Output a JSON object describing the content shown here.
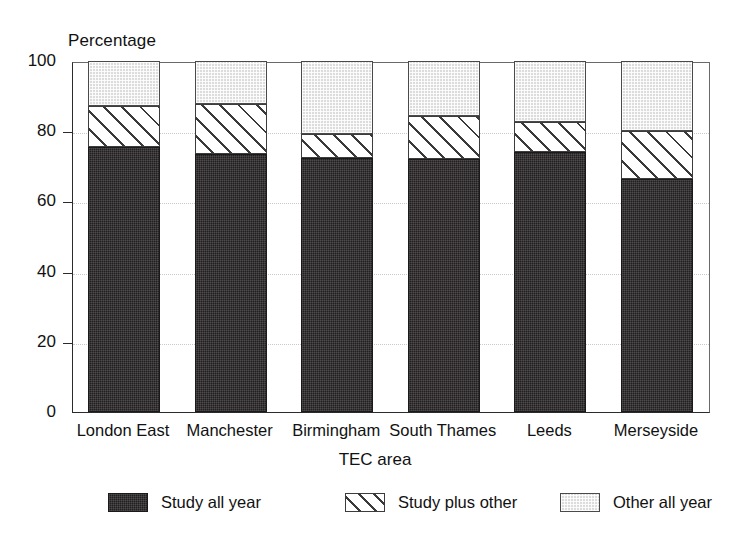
{
  "chart_data": {
    "type": "bar",
    "subtype": "stacked-bar",
    "title": "",
    "xlabel": "TEC area",
    "ylabel": "Percentage",
    "ylim": [
      0,
      100
    ],
    "yticks": [
      0,
      20,
      40,
      60,
      80,
      100
    ],
    "ytick_labels": [
      "0",
      "20",
      "40",
      "60",
      "80",
      "100"
    ],
    "grid": true,
    "legend_position": "bottom",
    "categories": [
      "London East",
      "Manchester",
      "Birmingham",
      "South Thames",
      "Leeds",
      "Merseyside"
    ],
    "series": [
      {
        "name": "Study all year",
        "fill": "dark-stipple",
        "color": "#231f20",
        "values": [
          75.5,
          73.5,
          72.5,
          72.0,
          74.0,
          66.5
        ]
      },
      {
        "name": "Study plus other",
        "fill": "diagonal-hatch",
        "color": "#ffffff",
        "values": [
          11.7,
          14.2,
          6.7,
          12.3,
          8.6,
          13.6
        ]
      },
      {
        "name": "Other all year",
        "fill": "light-stipple",
        "color": "#dcdcdc",
        "values": [
          12.8,
          12.3,
          20.8,
          15.7,
          17.4,
          19.9
        ]
      }
    ],
    "cumulative_tops": [
      [
        75.5,
        87.2,
        100
      ],
      [
        73.5,
        87.7,
        100
      ],
      [
        72.5,
        79.2,
        100
      ],
      [
        72.0,
        84.3,
        100
      ],
      [
        74.0,
        82.6,
        100
      ],
      [
        66.5,
        80.1,
        100
      ]
    ]
  },
  "legend": {
    "items": [
      {
        "label": "Study all year",
        "swatch": "dark"
      },
      {
        "label": "Study plus other",
        "swatch": "hatch"
      },
      {
        "label": "Other all year",
        "swatch": "light"
      }
    ]
  }
}
